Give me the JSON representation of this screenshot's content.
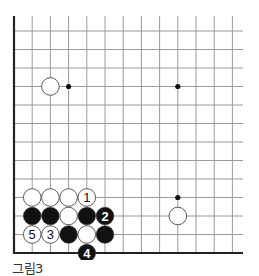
{
  "caption": "그림3",
  "board": {
    "origin_x": 14,
    "origin_y": 16,
    "spacing": 18.2,
    "cols": 13,
    "right_edge_x": 243,
    "bottom_y": 253,
    "row_count_visible": 13,
    "colors": {
      "line": "#9a9a9a",
      "edge": "#222222",
      "black": "#111111",
      "white": "#ffffff",
      "stone_outline": "#333333"
    },
    "hoshi": [
      {
        "col": 3,
        "row": 4
      },
      {
        "col": 9,
        "row": 4
      },
      {
        "col": 9,
        "row": 10
      }
    ],
    "stones": [
      {
        "color": "white",
        "col": 2,
        "row": 4,
        "label": ""
      },
      {
        "color": "white",
        "col": 9,
        "row": 11,
        "label": ""
      },
      {
        "color": "white",
        "col": 1,
        "row": 10,
        "label": ""
      },
      {
        "color": "white",
        "col": 2,
        "row": 10,
        "label": ""
      },
      {
        "color": "white",
        "col": 3,
        "row": 10,
        "label": ""
      },
      {
        "color": "white",
        "col": 4,
        "row": 10,
        "label": "1"
      },
      {
        "color": "black",
        "col": 1,
        "row": 11,
        "label": ""
      },
      {
        "color": "black",
        "col": 2,
        "row": 11,
        "label": ""
      },
      {
        "color": "white",
        "col": 3,
        "row": 11,
        "label": ""
      },
      {
        "color": "black",
        "col": 4,
        "row": 11,
        "label": ""
      },
      {
        "color": "black",
        "col": 5,
        "row": 11,
        "label": "2"
      },
      {
        "color": "white",
        "col": 1,
        "row": 12,
        "label": "5"
      },
      {
        "color": "white",
        "col": 2,
        "row": 12,
        "label": "3"
      },
      {
        "color": "black",
        "col": 3,
        "row": 12,
        "label": ""
      },
      {
        "color": "white",
        "col": 4,
        "row": 12,
        "label": ""
      },
      {
        "color": "black",
        "col": 5,
        "row": 12,
        "label": ""
      },
      {
        "color": "black",
        "col": 4,
        "row": 13,
        "label": "4"
      }
    ]
  }
}
